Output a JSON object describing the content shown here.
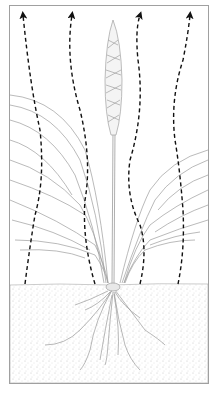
{
  "figure": {
    "elements": {
      "frame": "rectangular border",
      "arrows": "four dashed upward arrows showing water vapour rising",
      "plant": "grass-like plant with flower spike and broad leaves",
      "soil": "stippled soil layer with roots"
    },
    "colors": {
      "frame": "#a0a0a0",
      "arrow": "#111111",
      "plant": "#9a9a9a",
      "soil_dots": "#b8b8b8"
    },
    "arrow_count": 4
  }
}
